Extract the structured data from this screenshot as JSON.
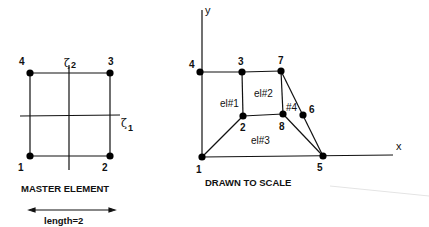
{
  "master": {
    "caption": "MASTER ELEMENT",
    "length_label": "length=2",
    "axis1": {
      "symbol": "ζ",
      "sub": "1"
    },
    "axis2": {
      "symbol": "ζ",
      "sub": "2"
    },
    "nodes": [
      {
        "id": "1",
        "x": 30,
        "y": 156,
        "lx": 18,
        "ly": 171
      },
      {
        "id": "2",
        "x": 110,
        "y": 156,
        "lx": 102,
        "ly": 171
      },
      {
        "id": "3",
        "x": 110,
        "y": 73,
        "lx": 108,
        "ly": 65
      },
      {
        "id": "4",
        "x": 30,
        "y": 73,
        "lx": 19,
        "ly": 65
      }
    ]
  },
  "scaled": {
    "caption": "DRAWN TO SCALE",
    "x_axis_label": "x",
    "y_axis_label": "y",
    "nodes": [
      {
        "id": "1",
        "x": 202,
        "y": 157,
        "lx": 196,
        "ly": 173
      },
      {
        "id": "2",
        "x": 243,
        "y": 116,
        "lx": 240,
        "ly": 131
      },
      {
        "id": "3",
        "x": 242,
        "y": 72,
        "lx": 238,
        "ly": 65
      },
      {
        "id": "4",
        "x": 200,
        "y": 72,
        "lx": 189,
        "ly": 68
      },
      {
        "id": "5",
        "x": 323,
        "y": 156,
        "lx": 317,
        "ly": 171
      },
      {
        "id": "6",
        "x": 303,
        "y": 115,
        "lx": 309,
        "ly": 113
      },
      {
        "id": "7",
        "x": 281,
        "y": 71,
        "lx": 278,
        "ly": 64
      },
      {
        "id": "8",
        "x": 283,
        "y": 114,
        "lx": 279,
        "ly": 130
      }
    ],
    "elements": [
      {
        "label": "el#1",
        "x": 220,
        "y": 107
      },
      {
        "label": "el#2",
        "x": 254,
        "y": 97
      },
      {
        "label": "el#3",
        "x": 251,
        "y": 144
      },
      {
        "label": "#4",
        "x": 286,
        "y": 111
      }
    ]
  }
}
